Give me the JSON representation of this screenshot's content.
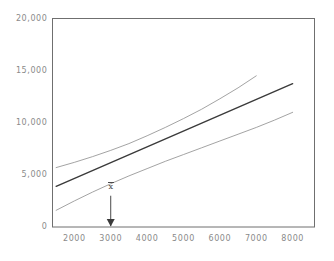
{
  "chart_data": {
    "type": "line",
    "title": "",
    "subtitle": "",
    "xlabel": "",
    "ylabel": "",
    "xlim": [
      1400,
      8600
    ],
    "ylim": [
      0,
      20000
    ],
    "grid": false,
    "legend": false,
    "legend_position": "none",
    "x_ticks": [
      "2000",
      "3000",
      "4000",
      "5000",
      "6000",
      "7000",
      "8000"
    ],
    "x_tick_values": [
      2000,
      3000,
      4000,
      5000,
      6000,
      7000,
      8000
    ],
    "y_ticks": [
      "0",
      "5,000",
      "10,000",
      "15,000",
      "20,000"
    ],
    "y_tick_values": [
      0,
      5000,
      10000,
      15000,
      20000
    ],
    "series": [
      {
        "name": "upper-confidence-band",
        "color": "#8c8c8c",
        "width": 0.8,
        "x": [
          1500,
          2000,
          2500,
          3000,
          3500,
          4000,
          4500,
          5000,
          5500,
          6000,
          6500,
          7000
        ],
        "values": [
          5700,
          6200,
          6750,
          7350,
          8000,
          8750,
          9550,
          10400,
          11300,
          12300,
          13350,
          14500
        ]
      },
      {
        "name": "regression-line",
        "color": "#3a3a3a",
        "width": 1.4,
        "x": [
          1500,
          8000
        ],
        "values": [
          3900,
          13750
        ]
      },
      {
        "name": "lower-confidence-band",
        "color": "#8c8c8c",
        "width": 0.8,
        "x": [
          1500,
          2000,
          2500,
          3000,
          3500,
          4000,
          4500,
          5000,
          5500,
          6000,
          6500,
          7000,
          7500,
          8000
        ],
        "values": [
          1600,
          2500,
          3350,
          4150,
          4900,
          5600,
          6300,
          6950,
          7600,
          8250,
          8900,
          9550,
          10250,
          11000
        ]
      }
    ],
    "annotations": [
      {
        "name": "x-bar-mean-marker",
        "label": "x",
        "overbar": true,
        "x": 3000,
        "arrow": "down",
        "arrow_from_y": 3000,
        "arrow_to_y": 0
      }
    ]
  },
  "axes": {
    "frame_color": "#6f6f6f",
    "tick_color": "#8a8a8a"
  }
}
